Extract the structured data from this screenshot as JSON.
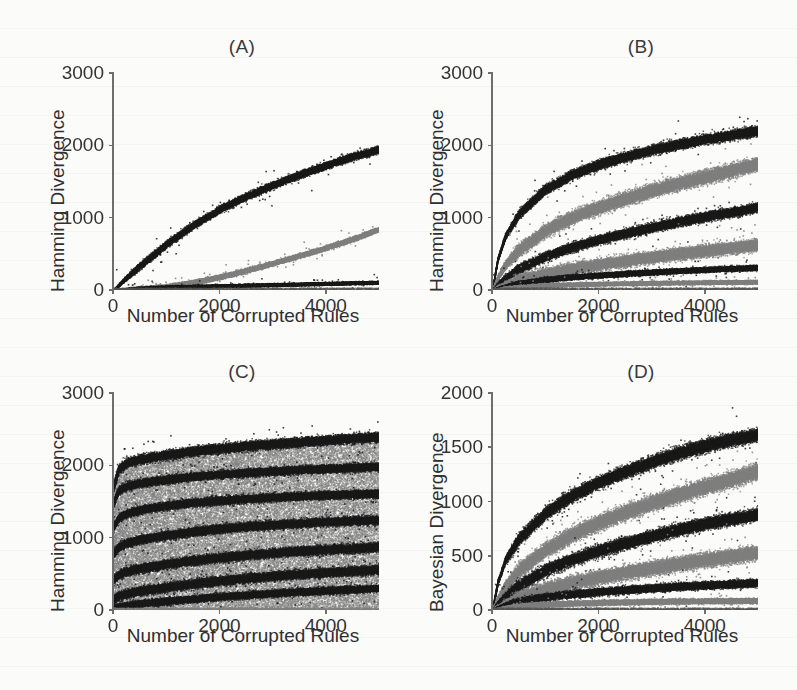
{
  "figure": {
    "background": "#fbfbf9",
    "ink_black": "#1a1a1a",
    "ink_gray": "#808080",
    "axis_color": "#6e6e6e"
  },
  "panels": [
    {
      "id": "A",
      "title": "(A)",
      "xlabel": "Number of Corrupted Rules",
      "ylabel": "Hamming Divergence",
      "xticks": [
        0,
        2000,
        4000
      ],
      "xtick_labels": [
        "0",
        "2000",
        "4000"
      ],
      "yticks": [
        0,
        1000,
        2000,
        3000
      ],
      "ytick_labels": [
        "0",
        "1000",
        "2000",
        "3000"
      ],
      "xlim": [
        0,
        5000
      ],
      "ylim": [
        0,
        3000
      ]
    },
    {
      "id": "B",
      "title": "(B)",
      "xlabel": "Number of Corrupted Rules",
      "ylabel": "Hamming Divergence",
      "xticks": [
        0,
        2000,
        4000
      ],
      "xtick_labels": [
        "0",
        "2000",
        "4000"
      ],
      "yticks": [
        0,
        1000,
        2000,
        3000
      ],
      "ytick_labels": [
        "0",
        "1000",
        "2000",
        "3000"
      ],
      "xlim": [
        0,
        5000
      ],
      "ylim": [
        0,
        3000
      ]
    },
    {
      "id": "C",
      "title": "(C)",
      "xlabel": "Number of Corrupted Rules",
      "ylabel": "Hamming Divergence",
      "xticks": [
        0,
        2000,
        4000
      ],
      "xtick_labels": [
        "0",
        "2000",
        "4000"
      ],
      "yticks": [
        0,
        1000,
        2000,
        3000
      ],
      "ytick_labels": [
        "0",
        "1000",
        "2000",
        "3000"
      ],
      "xlim": [
        0,
        5000
      ],
      "ylim": [
        0,
        3000
      ]
    },
    {
      "id": "D",
      "title": "(D)",
      "xlabel": "Number of Corrupted Rules",
      "ylabel": "Bayesian Divergence",
      "xticks": [
        0,
        2000,
        4000
      ],
      "xtick_labels": [
        "0",
        "2000",
        "4000"
      ],
      "yticks": [
        0,
        500,
        1000,
        1500,
        2000
      ],
      "ytick_labels": [
        "0",
        "500",
        "1000",
        "1500",
        "2000"
      ],
      "xlim": [
        0,
        5000
      ],
      "ylim": [
        0,
        2000
      ]
    }
  ],
  "chart_data": [
    {
      "panel": "A",
      "type": "scatter",
      "title": "(A)",
      "xlabel": "Number of Corrupted Rules",
      "ylabel": "Hamming Divergence",
      "xlim": [
        0,
        5000
      ],
      "ylim": [
        0,
        3000
      ],
      "xticks": [
        0,
        2000,
        4000
      ],
      "yticks": [
        0,
        1000,
        2000,
        3000
      ],
      "grid": false,
      "legend": "none",
      "x": [
        0,
        250,
        500,
        1000,
        1500,
        2000,
        2500,
        3000,
        3500,
        4000,
        4500,
        5000
      ],
      "series": [
        {
          "name": "band-1-black",
          "color": "#1a1a1a",
          "thickness": 70,
          "values": [
            0,
            180,
            340,
            640,
            900,
            1120,
            1300,
            1460,
            1600,
            1730,
            1850,
            1950
          ]
        },
        {
          "name": "band-2-gray",
          "color": "#808080",
          "thickness": 45,
          "values": [
            0,
            10,
            22,
            55,
            110,
            185,
            275,
            375,
            480,
            590,
            710,
            850
          ]
        },
        {
          "name": "band-3-black",
          "color": "#1a1a1a",
          "thickness": 26,
          "values": [
            0,
            18,
            30,
            45,
            55,
            62,
            70,
            78,
            86,
            94,
            102,
            110
          ]
        }
      ]
    },
    {
      "panel": "B",
      "type": "scatter",
      "title": "(B)",
      "xlabel": "Number of Corrupted Rules",
      "ylabel": "Hamming Divergence",
      "xlim": [
        0,
        5000
      ],
      "ylim": [
        0,
        3000
      ],
      "xticks": [
        0,
        2000,
        4000
      ],
      "yticks": [
        0,
        1000,
        2000,
        3000
      ],
      "grid": false,
      "legend": "none",
      "x": [
        0,
        100,
        250,
        500,
        1000,
        1500,
        2000,
        2500,
        3000,
        3500,
        4000,
        4500,
        5000
      ],
      "series": [
        {
          "name": "band-1-black",
          "color": "#1a1a1a",
          "thickness": 95,
          "values": [
            0,
            430,
            760,
            1060,
            1400,
            1600,
            1740,
            1850,
            1940,
            2020,
            2090,
            2150,
            2210
          ]
        },
        {
          "name": "band-2-gray",
          "color": "#808080",
          "thickness": 135,
          "values": [
            0,
            180,
            360,
            560,
            830,
            1010,
            1150,
            1270,
            1380,
            1480,
            1570,
            1660,
            1750
          ]
        },
        {
          "name": "band-3-black",
          "color": "#1a1a1a",
          "thickness": 90,
          "values": [
            0,
            80,
            180,
            300,
            470,
            600,
            700,
            790,
            870,
            950,
            1020,
            1080,
            1150
          ]
        },
        {
          "name": "band-4-gray",
          "color": "#808080",
          "thickness": 120,
          "values": [
            0,
            30,
            75,
            140,
            230,
            300,
            360,
            410,
            460,
            505,
            550,
            590,
            630
          ]
        },
        {
          "name": "band-5-black",
          "color": "#1a1a1a",
          "thickness": 48,
          "values": [
            0,
            30,
            60,
            100,
            150,
            185,
            210,
            232,
            252,
            270,
            288,
            302,
            318
          ]
        },
        {
          "name": "band-6-gray",
          "color": "#808080",
          "thickness": 34,
          "values": [
            0,
            18,
            32,
            50,
            70,
            82,
            90,
            96,
            102,
            106,
            110,
            114,
            118
          ]
        }
      ]
    },
    {
      "panel": "C",
      "type": "scatter",
      "title": "(C)",
      "xlabel": "Number of Corrupted Rules",
      "ylabel": "Hamming Divergence",
      "xlim": [
        0,
        5000
      ],
      "ylim": [
        0,
        3000
      ],
      "xticks": [
        0,
        2000,
        4000
      ],
      "yticks": [
        0,
        1000,
        2000,
        3000
      ],
      "grid": false,
      "legend": "none",
      "note": "dense gray cloud filling region below upper envelope, with black bands fanning out",
      "x": [
        0,
        100,
        250,
        500,
        1000,
        1500,
        2000,
        2500,
        3000,
        3500,
        4000,
        4500,
        5000
      ],
      "cloud": {
        "name": "gray-cloud",
        "color": "#808080",
        "lower": 0,
        "upper_envelope": [
          1700,
          1960,
          2050,
          2110,
          2180,
          2230,
          2270,
          2300,
          2330,
          2355,
          2380,
          2400,
          2420
        ]
      },
      "series": [
        {
          "name": "band-1-black",
          "color": "#1a1a1a",
          "thickness": 95,
          "values": [
            1700,
            1960,
            2040,
            2090,
            2150,
            2200,
            2240,
            2270,
            2300,
            2330,
            2355,
            2380,
            2400
          ]
        },
        {
          "name": "band-2-black",
          "color": "#1a1a1a",
          "thickness": 80,
          "values": [
            1480,
            1660,
            1720,
            1760,
            1810,
            1850,
            1880,
            1905,
            1925,
            1945,
            1960,
            1975,
            1990
          ]
        },
        {
          "name": "band-3-black",
          "color": "#1a1a1a",
          "thickness": 80,
          "values": [
            1150,
            1280,
            1340,
            1390,
            1450,
            1490,
            1520,
            1545,
            1565,
            1580,
            1595,
            1605,
            1615
          ]
        },
        {
          "name": "band-4-black",
          "color": "#1a1a1a",
          "thickness": 85,
          "values": [
            780,
            880,
            930,
            980,
            1040,
            1090,
            1130,
            1160,
            1185,
            1205,
            1225,
            1240,
            1255
          ]
        },
        {
          "name": "band-5-black",
          "color": "#1a1a1a",
          "thickness": 90,
          "values": [
            430,
            500,
            540,
            580,
            640,
            690,
            730,
            765,
            795,
            820,
            840,
            860,
            880
          ]
        },
        {
          "name": "band-6-black",
          "color": "#1a1a1a",
          "thickness": 90,
          "values": [
            150,
            200,
            230,
            270,
            320,
            370,
            410,
            445,
            475,
            500,
            525,
            545,
            565
          ]
        },
        {
          "name": "band-7-black",
          "color": "#1a1a1a",
          "thickness": 70,
          "values": [
            20,
            50,
            70,
            95,
            130,
            160,
            190,
            215,
            238,
            258,
            275,
            292,
            308
          ]
        }
      ]
    },
    {
      "panel": "D",
      "type": "scatter",
      "title": "(D)",
      "xlabel": "Number of Corrupted Rules",
      "ylabel": "Bayesian Divergence",
      "xlim": [
        0,
        5000
      ],
      "ylim": [
        0,
        2000
      ],
      "xticks": [
        0,
        2000,
        4000
      ],
      "yticks": [
        0,
        500,
        1000,
        1500,
        2000
      ],
      "grid": false,
      "legend": "none",
      "x": [
        0,
        100,
        250,
        500,
        1000,
        1500,
        2000,
        2500,
        3000,
        3500,
        4000,
        4500,
        5000
      ],
      "series": [
        {
          "name": "band-1-black",
          "color": "#1a1a1a",
          "thickness": 85,
          "values": [
            0,
            260,
            470,
            660,
            900,
            1060,
            1180,
            1280,
            1370,
            1450,
            1520,
            1575,
            1620
          ]
        },
        {
          "name": "band-2-gray",
          "color": "#808080",
          "thickness": 105,
          "values": [
            0,
            110,
            230,
            370,
            560,
            700,
            810,
            905,
            990,
            1070,
            1140,
            1210,
            1290
          ]
        },
        {
          "name": "band-3-black",
          "color": "#1a1a1a",
          "thickness": 80,
          "values": [
            0,
            60,
            135,
            230,
            370,
            470,
            550,
            620,
            685,
            745,
            800,
            845,
            885
          ]
        },
        {
          "name": "band-4-gray",
          "color": "#808080",
          "thickness": 95,
          "values": [
            0,
            25,
            60,
            115,
            195,
            255,
            305,
            350,
            390,
            430,
            465,
            500,
            535
          ]
        },
        {
          "name": "band-5-black",
          "color": "#1a1a1a",
          "thickness": 48,
          "values": [
            0,
            25,
            50,
            82,
            122,
            150,
            172,
            190,
            205,
            220,
            232,
            243,
            254
          ]
        },
        {
          "name": "band-6-gray",
          "color": "#808080",
          "thickness": 32,
          "values": [
            0,
            14,
            26,
            40,
            56,
            66,
            72,
            77,
            81,
            84,
            87,
            89,
            92
          ]
        }
      ]
    }
  ]
}
